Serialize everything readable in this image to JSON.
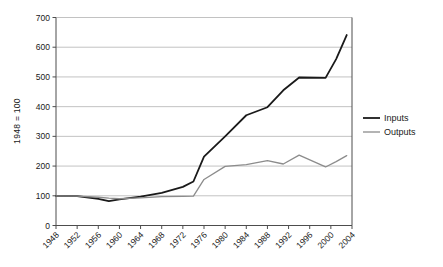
{
  "chart_data": {
    "type": "line",
    "title": "",
    "subtitle": "",
    "xlabel": "",
    "ylabel": "1948 = 100",
    "x": [
      1948,
      1952,
      1956,
      1958,
      1960,
      1964,
      1968,
      1972,
      1974,
      1976,
      1980,
      1984,
      1988,
      1991,
      1994,
      1999,
      2001,
      2003
    ],
    "xlim": [
      1948,
      2004
    ],
    "ylim": [
      0,
      700
    ],
    "ytick_values": [
      0,
      100,
      200,
      300,
      400,
      500,
      600,
      700
    ],
    "ytick_labels": [
      "0",
      "100",
      "200",
      "300",
      "400",
      "500",
      "600",
      "700"
    ],
    "xtick_values": [
      1948,
      1952,
      1956,
      1960,
      1964,
      1968,
      1972,
      1976,
      1980,
      1984,
      1988,
      1992,
      1996,
      2000,
      2004
    ],
    "xtick_labels": [
      "1948",
      "1952",
      "1956",
      "1960",
      "1964",
      "1968",
      "1972",
      "1976",
      "1980",
      "1984",
      "1988",
      "1992",
      "1996",
      "2000",
      "2004"
    ],
    "grid": "horizontal",
    "legend_position": "right",
    "series": [
      {
        "name": "Inputs",
        "color": "#1a1a1a",
        "width": 1.8,
        "points": [
          [
            1948,
            100
          ],
          [
            1952,
            99
          ],
          [
            1956,
            90
          ],
          [
            1958,
            82
          ],
          [
            1960,
            88
          ],
          [
            1964,
            97
          ],
          [
            1968,
            110
          ],
          [
            1972,
            130
          ],
          [
            1974,
            148
          ],
          [
            1976,
            232
          ],
          [
            1980,
            300
          ],
          [
            1984,
            371
          ],
          [
            1988,
            398
          ],
          [
            1991,
            455
          ],
          [
            1994,
            498
          ],
          [
            1999,
            497
          ],
          [
            2001,
            560
          ],
          [
            2003,
            641
          ]
        ]
      },
      {
        "name": "Outputs",
        "color": "#8c8c8c",
        "width": 1.3,
        "points": [
          [
            1948,
            100
          ],
          [
            1952,
            99
          ],
          [
            1956,
            95
          ],
          [
            1958,
            92
          ],
          [
            1960,
            90
          ],
          [
            1964,
            93
          ],
          [
            1968,
            97
          ],
          [
            1972,
            98
          ],
          [
            1974,
            99
          ],
          [
            1976,
            155
          ],
          [
            1980,
            199
          ],
          [
            1984,
            205
          ],
          [
            1988,
            218
          ],
          [
            1991,
            207
          ],
          [
            1994,
            237
          ],
          [
            1999,
            197
          ],
          [
            2001,
            215
          ],
          [
            2003,
            235
          ]
        ]
      }
    ]
  },
  "legend": {
    "items": [
      {
        "label": "Inputs",
        "color": "#1a1a1a"
      },
      {
        "label": "Outputs",
        "color": "#8c8c8c"
      }
    ]
  },
  "axes": {
    "y_title": "1948 = 100"
  }
}
